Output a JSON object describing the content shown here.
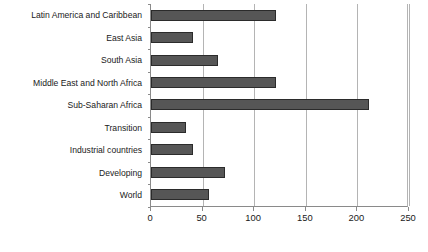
{
  "chart_data": {
    "type": "bar",
    "orientation": "horizontal",
    "title": "",
    "subtitle": "",
    "xlabel": "",
    "ylabel": "",
    "categories": [
      "Latin America and Caribbean",
      "East Asia",
      "South Asia",
      "Middle East and North Africa",
      "Sub-Saharan Africa",
      "Transition",
      "Industrial countries",
      "Developing",
      "World"
    ],
    "values": [
      121,
      41,
      65,
      121,
      211,
      34,
      41,
      72,
      56
    ],
    "xlim": [
      0,
      250
    ],
    "xticks": [
      0,
      50,
      100,
      150,
      200,
      250
    ],
    "xtick_labels": [
      "0",
      "50",
      "100",
      "150",
      "200",
      "250"
    ],
    "grid": true,
    "grid_axis": "x",
    "legend": false,
    "legend_entries": [],
    "annotations": [],
    "bar_color": "#565656",
    "bar_border_color": "#2b2b2b",
    "gridline_color": "#b4b4b4",
    "axis_color": "#8a8a8a",
    "background_color": "#ffffff",
    "text_color": "#1a1a1a"
  }
}
